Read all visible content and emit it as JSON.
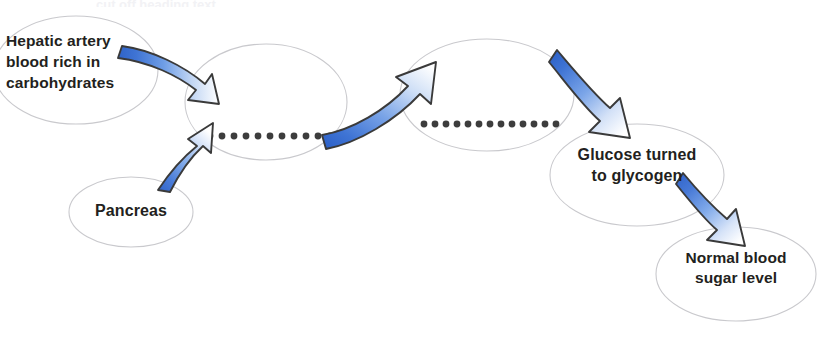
{
  "diagram": {
    "title_cutoff": "cut off heading text",
    "background_color": "#ffffff",
    "outline_color": "#c9c9cd",
    "text_color": "#231f20",
    "arrow_blue": "#3a6fd0",
    "arrow_blue_light": "#7ba6e8",
    "arrow_outline": "#3a3a3a",
    "dot_color": "#3d3d3d",
    "nodes": [
      {
        "id": "hepatic-artery",
        "label": "Hepatic artery\nblood rich in\ncarbohydrates",
        "cx": 76,
        "cy": 70,
        "rx": 82,
        "ry": 54
      },
      {
        "id": "middle-empty-1",
        "label": "",
        "cx": 266,
        "cy": 102,
        "rx": 81,
        "ry": 58
      },
      {
        "id": "pancreas",
        "label": "Pancreas",
        "cx": 131,
        "cy": 212,
        "rx": 62,
        "ry": 35
      },
      {
        "id": "middle-empty-2",
        "label": "",
        "cx": 487,
        "cy": 95,
        "rx": 87,
        "ry": 56
      },
      {
        "id": "glucose-glycogen",
        "label": "Glucose turned\nto glycogen",
        "cx": 637,
        "cy": 175,
        "rx": 87,
        "ry": 51
      },
      {
        "id": "normal-blood-sugar",
        "label": "Normal blood\nsugar level",
        "cx": 736,
        "cy": 274,
        "rx": 80,
        "ry": 47
      }
    ],
    "connectors": [
      {
        "id": "dotted-line-1",
        "type": "dotted",
        "dots": 11,
        "from_x": 208,
        "to_x": 326,
        "y": 136
      },
      {
        "id": "dotted-line-2",
        "type": "dotted",
        "dots": 13,
        "from_x": 422,
        "to_x": 551,
        "y": 124
      },
      {
        "id": "arrow-hepatic-to-middle1",
        "type": "arrow",
        "direction": "right"
      },
      {
        "id": "arrow-pancreas-to-middle1",
        "type": "arrow",
        "direction": "up-right"
      },
      {
        "id": "arrow-middle1-to-middle2",
        "type": "arrow",
        "direction": "up-right"
      },
      {
        "id": "arrow-middle2-to-glycogen",
        "type": "arrow",
        "direction": "down-right"
      },
      {
        "id": "arrow-glycogen-to-normal",
        "type": "arrow",
        "direction": "down-right"
      }
    ]
  }
}
